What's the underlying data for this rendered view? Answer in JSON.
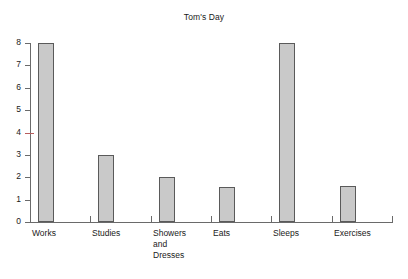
{
  "chart_data": {
    "type": "bar",
    "title": "Tom's Day",
    "categories": [
      "Works",
      "Studies",
      "Showers\nand\nDresses",
      "Eats",
      "Sleeps",
      "Exercises"
    ],
    "values": [
      8,
      3,
      2,
      1.55,
      8,
      1.6
    ],
    "xlabel": "",
    "ylabel": "",
    "ylim": [
      0,
      8
    ],
    "yticks": [
      0,
      1,
      2,
      3,
      4,
      5,
      6,
      7,
      8
    ],
    "ytick_labels": [
      "0",
      "1",
      "2",
      "3",
      "4",
      "5",
      "6",
      "7",
      "8"
    ],
    "grid": false,
    "legend": false,
    "bar_color": "#c9c9c9",
    "bar_edge_color": "#5a5a5a",
    "axis_color": "#6a6a6a",
    "accent_tick_color": "#b85c5c",
    "accent_tick_value": 4,
    "background": "#ffffff"
  },
  "labels": {
    "y0": "0",
    "y1": "1",
    "y2": "2",
    "y3": "3",
    "y4": "4",
    "y5": "5",
    "y6": "6",
    "y7": "7",
    "y8": "8",
    "cat0": "Works",
    "cat1": "Studies",
    "cat2": "Showers\nand\nDresses",
    "cat3": "Eats",
    "cat4": "Sleeps",
    "cat5": "Exercises"
  }
}
